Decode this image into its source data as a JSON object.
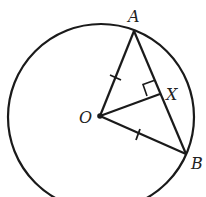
{
  "diagram": {
    "stroke_color": "#1a1a1a",
    "background": "#ffffff",
    "circle": {
      "cx": 101,
      "cy": 117,
      "r": 93
    },
    "points": {
      "A": {
        "x": 134,
        "y": 31,
        "label": "A"
      },
      "B": {
        "x": 186,
        "y": 154,
        "label": "B"
      },
      "O": {
        "x": 100,
        "y": 116,
        "label": "O"
      },
      "X": {
        "x": 160,
        "y": 94,
        "label": "X"
      }
    },
    "segments": [
      "OA",
      "OB",
      "AB",
      "OX"
    ],
    "equal_marks": [
      "OA",
      "OB"
    ],
    "right_angle_at": "X"
  }
}
